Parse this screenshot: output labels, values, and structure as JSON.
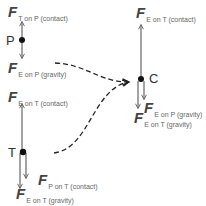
{
  "colors": {
    "arrow": "#666666",
    "dot": "#111111",
    "dash": "#222222",
    "text": "#444444"
  },
  "points": {
    "P": {
      "label": "P"
    },
    "T": {
      "label": "T"
    },
    "C": {
      "label": "C"
    }
  },
  "forces": {
    "p_up": {
      "symbol": "F",
      "subscript": "T on P (contact)"
    },
    "p_down": {
      "symbol": "F",
      "subscript": "E on P (gravity)"
    },
    "t_up": {
      "symbol": "F",
      "subscript": "E on T (contact)"
    },
    "t_down_contact": {
      "symbol": "F",
      "subscript": "P on T (contact)"
    },
    "t_down_gravity": {
      "symbol": "F",
      "subscript": "E on T (gravity)"
    },
    "c_up": {
      "symbol": "F",
      "subscript": "E on T (contact)"
    },
    "c_down_p": {
      "symbol": "F",
      "subscript": "E on P (gravity)"
    },
    "c_down_t": {
      "symbol": "F",
      "subscript": "E on T (gravity)"
    }
  }
}
